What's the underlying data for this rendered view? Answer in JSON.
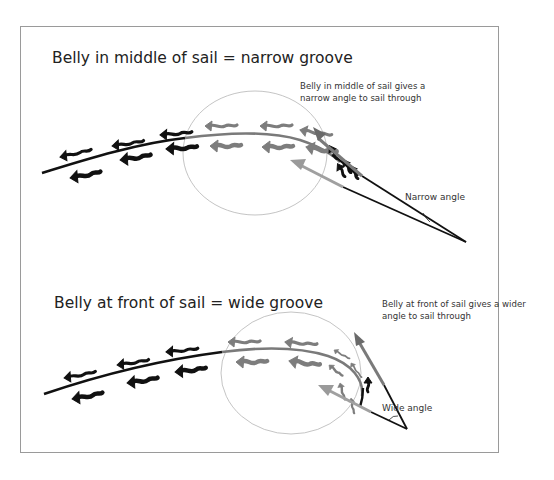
{
  "colors": {
    "frame": "#9a9a9a",
    "background": "#ffffff",
    "sail_black": "#111111",
    "sail_grey": "#7a7a7a",
    "flow_dark": "#111111",
    "flow_mid": "#7d7d7d",
    "flow_light": "#a6a6a6",
    "circle": "#bdbdbd"
  },
  "panels": [
    {
      "id": "narrow",
      "title": "Belly in middle of sail = narrow groove",
      "note_lines": [
        "Belly in middle of sail gives a",
        "narrow angle to sail through"
      ],
      "angle_label": "Narrow angle"
    },
    {
      "id": "wide",
      "title": "Belly at front of sail = wide groove",
      "note_lines": [
        "Belly at front of sail gives a wider",
        "angle to sail through"
      ],
      "angle_label": "Wide angle"
    }
  ],
  "icons": {
    "flow_arrow": "wavy-left-arrow-icon",
    "angle_arrow": "straight-arrow-icon"
  }
}
